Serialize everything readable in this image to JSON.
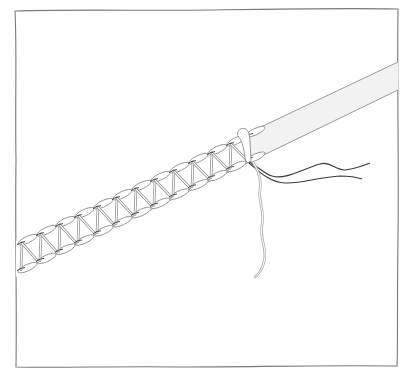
{
  "illustration": {
    "subject": "herringbone-stitch-on-tape",
    "colors": {
      "background": "#ffffff",
      "frame": "#7a7a7a",
      "tape_outline": "#9a9a9a",
      "tape_fill": "#f2f2f2",
      "stitch_thread": "#b8b8b8",
      "stitch_outline": "#8a8a8a",
      "dark_thread": "#3a3a3a",
      "light_thread": "#b0b0b0"
    },
    "stitch_count": 12
  }
}
